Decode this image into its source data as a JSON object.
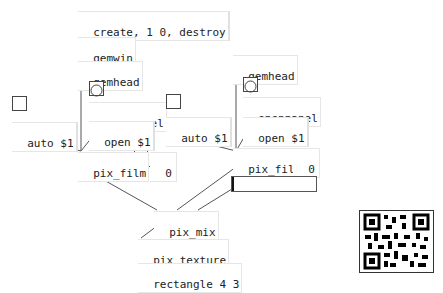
{
  "patch": {
    "messages": {
      "create_destroy": "create, 1 0, destroy",
      "open_left": "open $1",
      "open_right": "open $1",
      "auto_left": "auto $1",
      "auto_right": "auto $1"
    },
    "objects": {
      "gemwin": "gemwin",
      "gemhead_left": "gemhead",
      "gemhead_right": "gemhead",
      "openpanel_left": "openpanel",
      "openpanel_right": "openpanel",
      "pix_film_left": "pix_film",
      "pix_film_right": "pix_film",
      "pix_mix": "pix_mix",
      "pix_texture": "pix_texture",
      "rectangle": "rectangle 4 3"
    },
    "numbers": {
      "left_value": "0",
      "right_value": "0"
    },
    "slider": {
      "value": 0
    },
    "qr_code": "qr-code"
  }
}
